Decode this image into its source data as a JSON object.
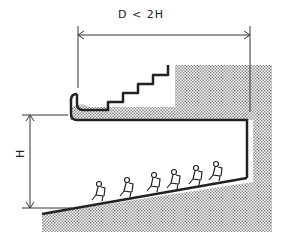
{
  "diagram": {
    "type": "section drawing",
    "labels": {
      "depth_rule": "D < 2H",
      "height": "H"
    },
    "elements": [
      "balcony with stepped seating",
      "shaded structure / wall",
      "sloped main floor",
      "six seated figures",
      "dimension line D",
      "dimension line H"
    ],
    "seated_figures_count": 6,
    "colors": {
      "line": "#222222",
      "hatch": "#9a9a9a",
      "background": "#ffffff"
    }
  }
}
